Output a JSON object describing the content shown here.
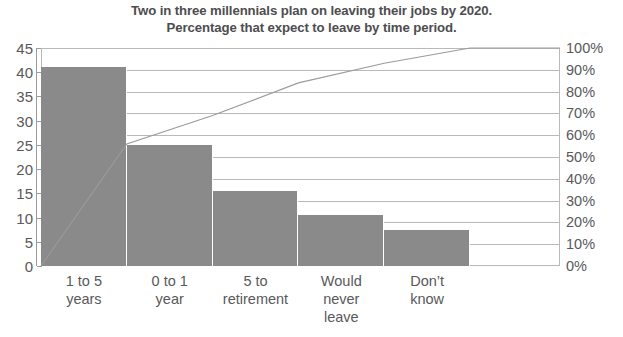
{
  "chart_data": {
    "type": "bar",
    "title": "Two in three millennials plan on leaving their jobs by 2020. Percentage that expect to leave by time period.",
    "title_lines": [
      "Two in three millennials plan on leaving their jobs by 2020.",
      "Percentage that expect to leave by time period."
    ],
    "categories": [
      "1 to 5 years",
      "0 to 1 year",
      "5 to retirement",
      "Would never leave",
      "Don’t know"
    ],
    "category_label_lines": [
      [
        "1 to 5",
        "years"
      ],
      [
        "0 to 1",
        "year"
      ],
      [
        "5 to",
        "retirement"
      ],
      [
        "Would",
        "never",
        "leave"
      ],
      [
        "Don’t",
        "know"
      ]
    ],
    "values": [
      41,
      25,
      15.5,
      10.6,
      7.5
    ],
    "series": [
      {
        "name": "Percentage",
        "type": "bar",
        "values": [
          41,
          25,
          15.5,
          10.6,
          7.5
        ]
      },
      {
        "name": "Cumulative percentage",
        "type": "line",
        "values": [
          56,
          69,
          84,
          93,
          100
        ]
      }
    ],
    "xlabel": "",
    "ylabel": "",
    "ylim": [
      0,
      45
    ],
    "yticks": [
      0,
      5,
      10,
      15,
      20,
      25,
      30,
      35,
      40,
      45
    ],
    "ytick_labels": [
      "0",
      "5",
      "10",
      "15",
      "20",
      "25",
      "30",
      "35",
      "40",
      "45"
    ],
    "y2lim": [
      0,
      100
    ],
    "y2ticks": [
      0,
      10,
      20,
      30,
      40,
      50,
      60,
      70,
      80,
      90,
      100
    ],
    "y2tick_labels": [
      "0%",
      "10%",
      "20%",
      "30%",
      "40%",
      "50%",
      "60%",
      "70%",
      "80%",
      "90%",
      "100%"
    ],
    "grid": true,
    "legend": "none",
    "colors": {
      "bar_fill": "#8a8a8a",
      "line": "#9b9b9b",
      "gridline": "#b9b9b9",
      "axis": "#9b9b9b",
      "text": "#58595b",
      "title_text": "#4d4d4f",
      "background": "#ffffff"
    }
  }
}
